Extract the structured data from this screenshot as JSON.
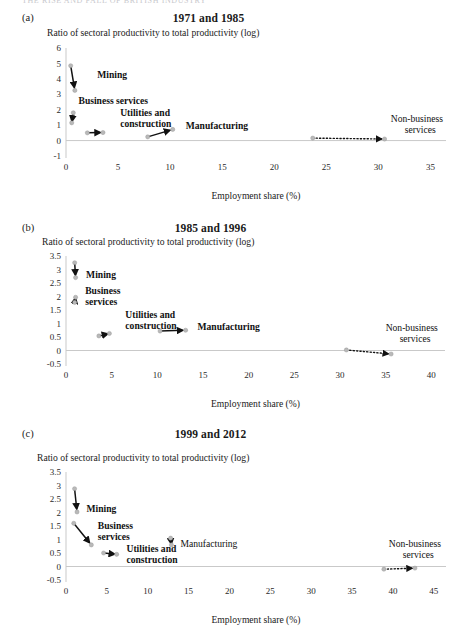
{
  "runhead": "THE RISE AND FALL OF BRITISH INDUSTRY",
  "common": {
    "ylabel": "Ratio of sectoral productivity to total productivity (log)",
    "xlabel": "Employment share (%)",
    "point_color": "#b9b9b9",
    "arrow_color": "#111111",
    "axis_color": "#c9c9c9"
  },
  "chart_data": [
    {
      "id": "a",
      "type": "scatter",
      "panel_letter": "(a)",
      "title": "1971 and 1985",
      "xlabel": "Employment share (%)",
      "ylabel": "Ratio of sectoral productivity to total productivity (log)",
      "xlim": [
        0,
        36.5
      ],
      "ylim": [
        -1,
        6
      ],
      "xticks": [
        "0",
        "5",
        "10",
        "15",
        "20",
        "25",
        "30",
        "35"
      ],
      "xtick_values": [
        0,
        5,
        10,
        15,
        20,
        25,
        30,
        35
      ],
      "yticks": [
        "-1",
        "0",
        "1",
        "2",
        "3",
        "4",
        "5",
        "6"
      ],
      "ytick_values": [
        -1,
        0,
        1,
        2,
        3,
        4,
        5,
        6
      ],
      "grid": false,
      "legend": "none",
      "series": [
        {
          "name": "Mining",
          "label_bold": true,
          "style": "solid",
          "start": {
            "x": 0.45,
            "y": 4.85
          },
          "end": {
            "x": 0.85,
            "y": 3.25
          },
          "label_x": 3.0,
          "label_y": 4.05,
          "anchor": "start"
        },
        {
          "name": "Business services",
          "label_bold": true,
          "style": "solid",
          "start": {
            "x": 0.7,
            "y": 1.8
          },
          "end": {
            "x": 0.55,
            "y": 1.15
          },
          "label_x": 1.2,
          "label_y": 2.35,
          "anchor": "start"
        },
        {
          "name": "Utilities and construction",
          "label_bold": true,
          "style": "solid",
          "start": {
            "x": 2.05,
            "y": 0.5
          },
          "end": {
            "x": 3.55,
            "y": 0.52
          },
          "label_x": 5.2,
          "label_y": 1.62,
          "anchor": "start"
        },
        {
          "name": "Manufacturing",
          "label_bold": true,
          "style": "solid",
          "start": {
            "x": 7.85,
            "y": 0.24
          },
          "end": {
            "x": 10.25,
            "y": 0.72
          },
          "label_x": 11.5,
          "label_y": 0.72,
          "anchor": "start"
        },
        {
          "name": "Non-business services",
          "label_bold": false,
          "style": "dotted",
          "start": {
            "x": 23.7,
            "y": 0.16
          },
          "end": {
            "x": 30.6,
            "y": 0.1
          },
          "label_x": 31.2,
          "label_y": 1.22,
          "anchor": "start"
        }
      ]
    },
    {
      "id": "b",
      "type": "scatter",
      "panel_letter": "(b)",
      "title": "1985 and 1996",
      "xlabel": "Employment share (%)",
      "ylabel": "Ratio of sectoral productivity to total productivity (log)",
      "xlim": [
        0,
        41.5
      ],
      "ylim": [
        -0.5,
        3.5
      ],
      "xticks": [
        "0",
        "5",
        "10",
        "15",
        "20",
        "25",
        "30",
        "35",
        "40"
      ],
      "xtick_values": [
        0,
        5,
        10,
        15,
        20,
        25,
        30,
        35,
        40
      ],
      "yticks": [
        "-0.5",
        "0",
        "0.5",
        "1",
        "1.5",
        "2",
        "2.5",
        "3",
        "3.5"
      ],
      "ytick_values": [
        -0.5,
        0,
        0.5,
        1,
        1.5,
        2,
        2.5,
        3,
        3.5
      ],
      "grid": false,
      "legend": "none",
      "series": [
        {
          "name": "Mining",
          "label_bold": true,
          "style": "solid",
          "start": {
            "x": 0.95,
            "y": 3.25
          },
          "end": {
            "x": 1.05,
            "y": 2.7
          },
          "label_x": 2.2,
          "label_y": 2.7,
          "anchor": "start"
        },
        {
          "name": "Business services",
          "label_bold": true,
          "style": "solid",
          "start": {
            "x": 0.95,
            "y": 1.78
          },
          "end": {
            "x": 1.05,
            "y": 1.97
          },
          "label_x": 2.1,
          "label_y": 2.1,
          "anchor": "start"
        },
        {
          "name": "Utilities and construction",
          "label_bold": true,
          "style": "solid",
          "start": {
            "x": 3.6,
            "y": 0.54
          },
          "end": {
            "x": 4.75,
            "y": 0.63
          },
          "label_x": 6.5,
          "label_y": 1.22,
          "anchor": "start"
        },
        {
          "name": "Manufacturing",
          "label_bold": true,
          "style": "solid",
          "start": {
            "x": 10.3,
            "y": 0.72
          },
          "end": {
            "x": 13.1,
            "y": 0.75
          },
          "label_x": 14.4,
          "label_y": 0.76,
          "anchor": "start"
        },
        {
          "name": "Non-business services",
          "label_bold": false,
          "style": "dotted",
          "start": {
            "x": 30.7,
            "y": 0.02
          },
          "end": {
            "x": 35.6,
            "y": -0.13
          },
          "label_x": 35.0,
          "label_y": 0.72,
          "anchor": "start"
        }
      ]
    },
    {
      "id": "c",
      "type": "scatter",
      "panel_letter": "(c)",
      "title": "1999 and 2012",
      "xlabel": "Employment share (%)",
      "ylabel": "Ratio of sectoral productivity to total productivity (log)",
      "xlim": [
        0,
        46.5
      ],
      "ylim": [
        -0.5,
        3.5
      ],
      "xticks": [
        "0",
        "5",
        "10",
        "15",
        "20",
        "25",
        "30",
        "35",
        "40",
        "45"
      ],
      "xtick_values": [
        0,
        5,
        10,
        15,
        20,
        25,
        30,
        35,
        40,
        45
      ],
      "yticks": [
        "-0.5",
        "0",
        "0.5",
        "1",
        "1.5",
        "2",
        "2.5",
        "3",
        "3.5"
      ],
      "ytick_values": [
        -0.5,
        0,
        0.5,
        1,
        1.5,
        2,
        2.5,
        3,
        3.5
      ],
      "grid": false,
      "legend": "none",
      "series": [
        {
          "name": "Mining",
          "label_bold": true,
          "style": "solid",
          "start": {
            "x": 1.05,
            "y": 2.88
          },
          "end": {
            "x": 1.35,
            "y": 2.02
          },
          "label_x": 2.5,
          "label_y": 2.02,
          "anchor": "start"
        },
        {
          "name": "Business services",
          "label_bold": true,
          "style": "solid",
          "start": {
            "x": 0.95,
            "y": 1.6
          },
          "end": {
            "x": 3.1,
            "y": 0.8
          },
          "label_x": 3.9,
          "label_y": 1.38,
          "anchor": "start"
        },
        {
          "name": "Utilities and construction",
          "label_bold": true,
          "style": "solid",
          "start": {
            "x": 4.6,
            "y": 0.5
          },
          "end": {
            "x": 6.2,
            "y": 0.45
          },
          "label_x": 7.4,
          "label_y": 0.52,
          "anchor": "start"
        },
        {
          "name": "Manufacturing",
          "label_bold": false,
          "style": "solid",
          "start": {
            "x": 12.8,
            "y": 1.05
          },
          "end": {
            "x": 12.9,
            "y": 0.8
          },
          "label_x": 14.0,
          "label_y": 0.74,
          "anchor": "start"
        },
        {
          "name": "Non-business services",
          "label_bold": false,
          "style": "dotted",
          "start": {
            "x": 38.9,
            "y": -0.1
          },
          "end": {
            "x": 42.7,
            "y": -0.06
          },
          "label_x": 39.5,
          "label_y": 0.74,
          "anchor": "start"
        }
      ]
    }
  ]
}
